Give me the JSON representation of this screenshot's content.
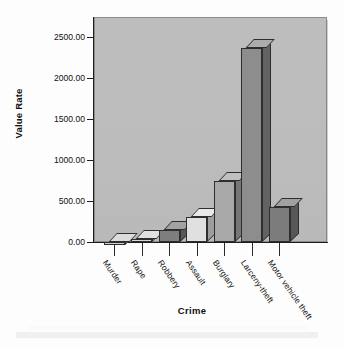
{
  "chart_data": {
    "type": "bar",
    "title": "",
    "subtitle": "",
    "xlabel": "Crime",
    "ylabel": "Value Rate",
    "categories": [
      "Murder",
      "Rape",
      "Robbery",
      "Assault",
      "Burglary",
      "Larceny-theft",
      "Motor vehicle theft"
    ],
    "values": [
      6,
      32,
      145,
      310,
      740,
      2370,
      430
    ],
    "ylim": [
      0,
      2750
    ],
    "ytick_labels": [
      "0.00",
      "500.00",
      "1000.00",
      "1500.00",
      "2000.00",
      "2500.00"
    ],
    "ytick_values": [
      0,
      500,
      1000,
      1500,
      2000,
      2500
    ],
    "grid": false,
    "legend": "none",
    "style": "3d-bars",
    "bar_colors": [
      "#cfcfcf",
      "#d6d6d6",
      "#7e7e7e",
      "#e0e0e0",
      "#a8a8a8",
      "#8d8d8d",
      "#7c7c7c"
    ],
    "plot_background": "#bdbdbd"
  },
  "axes": {
    "y_title": "Value Rate",
    "x_title": "Crime"
  }
}
